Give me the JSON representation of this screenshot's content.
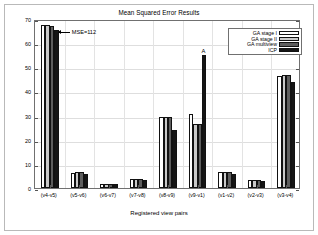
{
  "chart_data": {
    "type": "bar",
    "title": "Mean Squared Error Results",
    "xlabel": "Registered view pairs",
    "ylabel": "MSE",
    "ylim": [
      0,
      70
    ],
    "yticks": [
      0,
      10,
      20,
      30,
      40,
      50,
      60,
      70
    ],
    "grid": true,
    "legend_position": "top-right",
    "categories": [
      "(v4-v5)",
      "(v5-v6)",
      "(v6-v7)",
      "(v7-v8)",
      "(v8-v9)",
      "(v9-v1)",
      "(v1-v2)",
      "(v2-v3)",
      "(v3-v4)"
    ],
    "series": [
      {
        "name": "GA stage I",
        "swatch": "s0",
        "color": "#ffffff",
        "values": [
          67.5,
          6.2,
          1.6,
          3.7,
          29.5,
          30.5,
          6.5,
          3.2,
          46.5
        ]
      },
      {
        "name": "GA stage II",
        "swatch": "s1",
        "color": "#c9c9c9",
        "values": [
          67.5,
          6.8,
          1.6,
          3.8,
          29.6,
          26.5,
          6.8,
          3.5,
          47.0
        ]
      },
      {
        "name": "GA multiview",
        "swatch": "s2",
        "color": "#5e5e5e",
        "values": [
          67.0,
          6.5,
          1.7,
          3.7,
          29.5,
          26.5,
          6.5,
          3.3,
          47.0
        ]
      },
      {
        "name": "ICP",
        "swatch": "s3",
        "color": "#151515",
        "values": [
          65.5,
          6.0,
          1.7,
          3.5,
          24.0,
          55.0,
          6.0,
          3.0,
          44.0
        ]
      }
    ],
    "annotations": [
      {
        "text": "MSE=112",
        "target_category": "(v4-v5)",
        "target_series": "ICP"
      },
      {
        "text": "A",
        "target_category": "(v9-v1)",
        "target_series": "ICP"
      }
    ]
  }
}
